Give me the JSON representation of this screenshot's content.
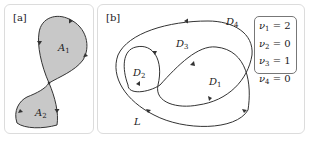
{
  "panels": {
    "a": {
      "tag": "[a]",
      "regions": [
        {
          "name": "A",
          "sub": "1"
        },
        {
          "name": "A",
          "sub": "2"
        }
      ],
      "fill_color": "#c8c8c8",
      "stroke_color": "#333333"
    },
    "b": {
      "tag": "[b]",
      "regions": [
        {
          "name": "D",
          "sub": "1"
        },
        {
          "name": "D",
          "sub": "2"
        },
        {
          "name": "D",
          "sub": "3"
        },
        {
          "name": "D",
          "sub": "4"
        }
      ],
      "curve_label": "L",
      "stroke_color": "#333333",
      "legend": [
        {
          "sym": "ν",
          "sub": "1",
          "eq": " = 2"
        },
        {
          "sym": "ν",
          "sub": "2",
          "eq": " = 0"
        },
        {
          "sym": "ν",
          "sub": "3",
          "eq": " = 1"
        },
        {
          "sym": "ν",
          "sub": "4",
          "eq": " = 0"
        }
      ]
    }
  }
}
